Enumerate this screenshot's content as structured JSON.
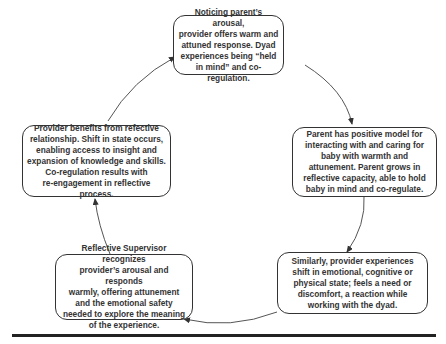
{
  "diagram": {
    "type": "cycle",
    "nodes": [
      {
        "id": "top",
        "text": "Noticing parent’s arousal,\nprovider offers warm and\nattuned response. Dyad\nexperiences being “held\nin mind” and co-regulation."
      },
      {
        "id": "right",
        "text": "Parent has positive model for\ninteracting with and caring for\nbaby with warmth and\nattunement. Parent grows in\nreflective capacity, able to hold\nbaby in mind and co-regulate."
      },
      {
        "id": "bottom-right",
        "text": "Similarly, provider experiences\nshift in emotional, cognitive or\nphysical state; feels a need or\ndiscomfort, a reaction while\nworking with the dyad."
      },
      {
        "id": "bottom-left",
        "text": "Reflective Supervisor recognizes\nprovider’s arousal and responds\nwarmly, offering attunement\nand the emotional safety\nneeded to explore the meaning\nof the experience."
      },
      {
        "id": "left",
        "text": "Provider benefits from refective\nrelationship. Shift in state occurs,\nenabling access to insight and\nexpansion of knowledge and skills.\nCo-regulation results with\nre-engagement in reflective process."
      }
    ],
    "edges": [
      {
        "from": "top",
        "to": "right"
      },
      {
        "from": "right",
        "to": "bottom-right"
      },
      {
        "from": "bottom-right",
        "to": "bottom-left"
      },
      {
        "from": "bottom-left",
        "to": "left"
      },
      {
        "from": "left",
        "to": "top"
      }
    ],
    "colors": {
      "stroke": "#333333",
      "text": "#333333",
      "rule": "#222222"
    }
  }
}
